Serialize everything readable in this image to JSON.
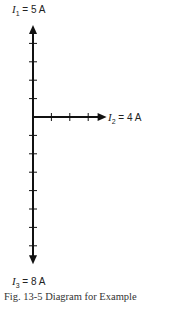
{
  "diagram": {
    "type": "phasor-diagram",
    "origin": {
      "x": 33,
      "y": 117
    },
    "unit_px": 18.4,
    "phasors": [
      {
        "name": "I1",
        "symbol": "I",
        "subscript": "1",
        "value": "5 A",
        "magnitude": 5,
        "direction": "up",
        "label": "= 5 A"
      },
      {
        "name": "I2",
        "symbol": "I",
        "subscript": "2",
        "value": "4 A",
        "magnitude": 4,
        "direction": "right",
        "label": "= 4 A"
      },
      {
        "name": "I3",
        "symbol": "I",
        "subscript": "3",
        "value": "8 A",
        "magnitude": 8,
        "direction": "down",
        "label": "= 8 A"
      }
    ],
    "color": "#111111"
  },
  "caption": "Fig. 13-5   Diagram for Example"
}
